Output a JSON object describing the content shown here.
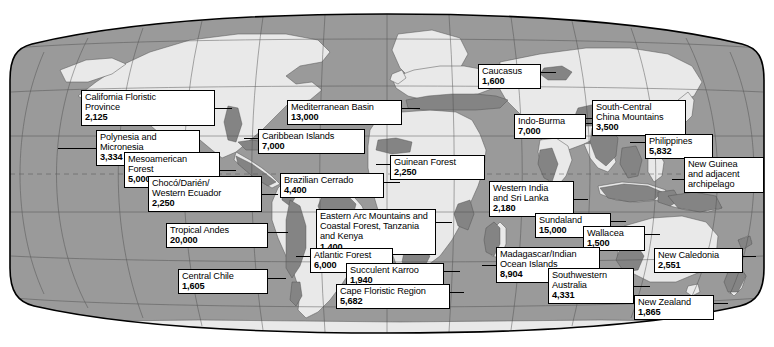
{
  "figure": {
    "type": "map",
    "projection": "robinson-like oval world map",
    "background_color": "#ffffff",
    "ocean_color": "#9a9a9a",
    "land_color": "#e8e8e8",
    "hotspot_color": "#808080",
    "border_color": "#000000",
    "graticule_color": "#4d4d4d"
  },
  "hotspots": [
    {
      "id": "california-floristic-province",
      "name": "California Floristic\nProvince",
      "name_lines": [
        "California Floristic",
        "Province"
      ],
      "value": "2,125",
      "box": {
        "x": 81,
        "y": 90,
        "w": 134,
        "h": 36
      },
      "leader": {
        "x1": 215,
        "y1": 108,
        "x2": 232,
        "y2": 108
      }
    },
    {
      "id": "polynesia-and-micronesia",
      "name_lines": [
        "Polynesia and",
        "Micronesia"
      ],
      "value": "3,334",
      "box": {
        "x": 96,
        "y": 130,
        "w": 104,
        "h": 36
      },
      "leader": {
        "x1": 58,
        "y1": 148,
        "x2": 96,
        "y2": 148
      }
    },
    {
      "id": "mesoamerican-forest",
      "name_lines": [
        "Mesoamerican",
        "Forest"
      ],
      "value": "5,000",
      "box": {
        "x": 124,
        "y": 152,
        "w": 96,
        "h": 36
      },
      "leader": {
        "x1": 220,
        "y1": 170,
        "x2": 236,
        "y2": 170
      }
    },
    {
      "id": "choco-darien-western-ecuador",
      "name_lines": [
        "Chocó/Darién/",
        "Western Ecuador"
      ],
      "value": "2,250",
      "box": {
        "x": 148,
        "y": 176,
        "w": 114,
        "h": 36
      },
      "leader": {
        "x1": 262,
        "y1": 194,
        "x2": 278,
        "y2": 194
      }
    },
    {
      "id": "tropical-andes",
      "name_lines": [
        "Tropical Andes"
      ],
      "value": "20,000",
      "box": {
        "x": 166,
        "y": 223,
        "w": 102,
        "h": 26
      },
      "leader": {
        "x1": 268,
        "y1": 232,
        "x2": 288,
        "y2": 232
      }
    },
    {
      "id": "central-chile",
      "name_lines": [
        "Central Chile"
      ],
      "value": "1,605",
      "box": {
        "x": 178,
        "y": 269,
        "w": 90,
        "h": 26
      },
      "leader": {
        "x1": 268,
        "y1": 278,
        "x2": 286,
        "y2": 278
      }
    },
    {
      "id": "mediterranean-basin",
      "name_lines": [
        "Mediterranean Basin"
      ],
      "value": "13,000",
      "box": {
        "x": 287,
        "y": 100,
        "w": 115,
        "h": 26
      },
      "leader": {
        "x1": 402,
        "y1": 108,
        "x2": 420,
        "y2": 108
      }
    },
    {
      "id": "caribbean-islands",
      "name_lines": [
        "Caribbean Islands"
      ],
      "value": "7,000",
      "box": {
        "x": 258,
        "y": 129,
        "w": 107,
        "h": 26
      },
      "leader": {
        "x1": 258,
        "y1": 138,
        "x2": 244,
        "y2": 138
      }
    },
    {
      "id": "brazilian-cerrado",
      "name_lines": [
        "Brazilian Cerrado"
      ],
      "value": "4,400",
      "box": {
        "x": 280,
        "y": 173,
        "w": 104,
        "h": 26
      },
      "leader": {
        "x1": 384,
        "y1": 182,
        "x2": 400,
        "y2": 182
      }
    },
    {
      "id": "guinean-forest",
      "name_lines": [
        "Guinean Forest"
      ],
      "value": "2,250",
      "box": {
        "x": 390,
        "y": 155,
        "w": 95,
        "h": 26
      },
      "leader": {
        "x1": 390,
        "y1": 164,
        "x2": 376,
        "y2": 164
      }
    },
    {
      "id": "eastern-arc-mountains",
      "name_lines": [
        "Eastern Arc Mountains and",
        "Coastal Forest, Tanzania",
        "and Kenya"
      ],
      "value": "1,400",
      "box": {
        "x": 316,
        "y": 209,
        "w": 120,
        "h": 46
      },
      "leader": {
        "x1": 436,
        "y1": 222,
        "x2": 452,
        "y2": 222
      }
    },
    {
      "id": "atlantic-forest",
      "name_lines": [
        "Atlantic Forest"
      ],
      "value": "6,000",
      "box": {
        "x": 310,
        "y": 248,
        "w": 83,
        "h": 26
      },
      "leader": {
        "x1": 310,
        "y1": 256,
        "x2": 296,
        "y2": 256
      }
    },
    {
      "id": "succulent-karroo",
      "name_lines": [
        "Succulent Karroo"
      ],
      "value": "1,940",
      "box": {
        "x": 346,
        "y": 263,
        "w": 98,
        "h": 26
      },
      "leader": {
        "x1": 444,
        "y1": 271,
        "x2": 460,
        "y2": 271
      }
    },
    {
      "id": "cape-floristic-region",
      "name_lines": [
        "Cape Floristic Region"
      ],
      "value": "5,682",
      "box": {
        "x": 336,
        "y": 284,
        "w": 114,
        "h": 26
      },
      "leader": {
        "x1": 450,
        "y1": 292,
        "x2": 464,
        "y2": 292
      }
    },
    {
      "id": "caucasus",
      "name_lines": [
        "Caucasus"
      ],
      "value": "1,600",
      "box": {
        "x": 478,
        "y": 64,
        "w": 63,
        "h": 26
      },
      "leader": {
        "x1": 541,
        "y1": 72,
        "x2": 556,
        "y2": 72
      }
    },
    {
      "id": "indo-burma",
      "name_lines": [
        "Indo-Burma"
      ],
      "value": "7,000",
      "box": {
        "x": 514,
        "y": 114,
        "w": 72,
        "h": 26
      },
      "leader": {
        "x1": 586,
        "y1": 123,
        "x2": 600,
        "y2": 123
      }
    },
    {
      "id": "south-central-china-mountains",
      "name_lines": [
        "South-Central",
        "China Mountains"
      ],
      "value": "3,500",
      "box": {
        "x": 592,
        "y": 100,
        "w": 94,
        "h": 36
      },
      "leader": {
        "x1": 592,
        "y1": 118,
        "x2": 578,
        "y2": 118
      }
    },
    {
      "id": "philippines",
      "name_lines": [
        "Philippines"
      ],
      "value": "5,832",
      "box": {
        "x": 645,
        "y": 134,
        "w": 68,
        "h": 26
      },
      "leader": {
        "x1": 645,
        "y1": 142,
        "x2": 630,
        "y2": 142
      }
    },
    {
      "id": "new-guinea-and-adjacent-archipelago",
      "name_lines": [
        "New Guinea",
        "and adjacent",
        "archipelago"
      ],
      "value": "",
      "box": {
        "x": 684,
        "y": 157,
        "w": 80,
        "h": 44
      },
      "leader": {
        "x1": 684,
        "y1": 179,
        "x2": 672,
        "y2": 179
      }
    },
    {
      "id": "western-india-and-sri-lanka",
      "name_lines": [
        "Western India",
        "and Sri Lanka"
      ],
      "value": "2,180",
      "box": {
        "x": 489,
        "y": 181,
        "w": 85,
        "h": 36
      },
      "leader": {
        "x1": 574,
        "y1": 199,
        "x2": 588,
        "y2": 199
      }
    },
    {
      "id": "sundaland",
      "name_lines": [
        "Sundaland"
      ],
      "value": "15,000",
      "box": {
        "x": 535,
        "y": 213,
        "w": 76,
        "h": 26
      },
      "leader": {
        "x1": 611,
        "y1": 221,
        "x2": 626,
        "y2": 221
      }
    },
    {
      "id": "wallacea",
      "name_lines": [
        "Wallacea"
      ],
      "value": "1,500",
      "box": {
        "x": 583,
        "y": 226,
        "w": 62,
        "h": 26
      },
      "leader": {
        "x1": 645,
        "y1": 234,
        "x2": 660,
        "y2": 234
      }
    },
    {
      "id": "madagascar-indian-ocean-islands",
      "name_lines": [
        "Madagascar/Indian",
        "Ocean Islands"
      ],
      "value": "8,904",
      "box": {
        "x": 496,
        "y": 247,
        "w": 104,
        "h": 36
      },
      "leader": {
        "x1": 496,
        "y1": 265,
        "x2": 482,
        "y2": 265
      }
    },
    {
      "id": "southwestern-australia",
      "name_lines": [
        "Southwestern",
        "Australia"
      ],
      "value": "4,331",
      "box": {
        "x": 548,
        "y": 268,
        "w": 86,
        "h": 36
      },
      "leader": {
        "x1": 634,
        "y1": 286,
        "x2": 650,
        "y2": 286
      }
    },
    {
      "id": "new-caledonia",
      "name_lines": [
        "New Caledonia"
      ],
      "value": "2,551",
      "box": {
        "x": 654,
        "y": 248,
        "w": 89,
        "h": 26
      },
      "leader": {
        "x1": 743,
        "y1": 256,
        "x2": 756,
        "y2": 256
      }
    },
    {
      "id": "new-zealand",
      "name_lines": [
        "New Zealand"
      ],
      "value": "1,865",
      "box": {
        "x": 634,
        "y": 295,
        "w": 80,
        "h": 26
      },
      "leader": {
        "x1": 714,
        "y1": 303,
        "x2": 728,
        "y2": 303
      }
    }
  ]
}
